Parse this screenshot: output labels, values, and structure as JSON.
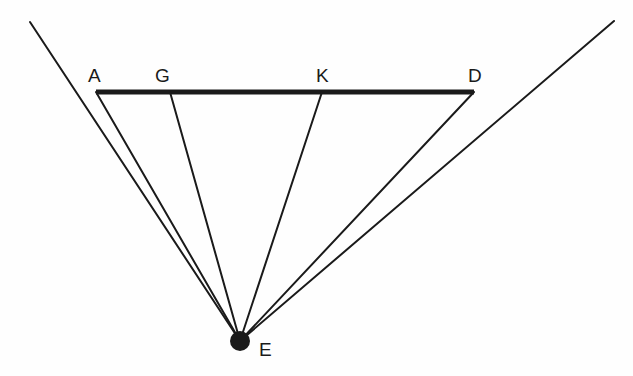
{
  "diagram": {
    "points": {
      "A": {
        "label": "A",
        "x": 96,
        "y": 92,
        "label_x": 88,
        "label_y": 82
      },
      "G": {
        "label": "G",
        "x": 170,
        "y": 92,
        "label_x": 155,
        "label_y": 82
      },
      "K": {
        "label": "K",
        "x": 322,
        "y": 92,
        "label_x": 316,
        "label_y": 82
      },
      "D": {
        "label": "D",
        "x": 474,
        "y": 92,
        "label_x": 468,
        "label_y": 82
      },
      "E": {
        "label": "E",
        "x": 240,
        "y": 341,
        "label_x": 259,
        "label_y": 356
      }
    },
    "segments": [
      {
        "name": "AD",
        "from": "A",
        "to": "D",
        "style": "thick"
      },
      {
        "name": "AE",
        "from": "A",
        "to": "E",
        "style": "thin"
      },
      {
        "name": "GE",
        "from": "G",
        "to": "E",
        "style": "thin"
      },
      {
        "name": "KE",
        "from": "K",
        "to": "E",
        "style": "thin"
      },
      {
        "name": "DE",
        "from": "D",
        "to": "E",
        "style": "thin"
      }
    ],
    "rays": [
      {
        "name": "left-boundary",
        "x1": 30,
        "y1": 22,
        "to": "E"
      },
      {
        "name": "right-boundary",
        "x1": 614,
        "y1": 21,
        "to": "E"
      }
    ],
    "eye_dot": {
      "point": "E",
      "radius": 10
    },
    "colors": {
      "stroke": "#1a1a1a",
      "background": "#fefefe"
    }
  }
}
